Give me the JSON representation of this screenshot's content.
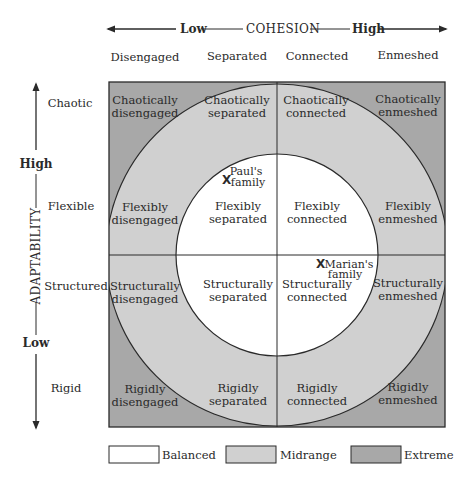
{
  "colors": {
    "balanced": "#ffffff",
    "midrange": "#d0d0d0",
    "extreme": "#a8a8a8",
    "line": "#2a2a2a",
    "text": "#2a2a2a"
  },
  "cohesion_axis": {
    "title": "COHESION",
    "low_label": "Low",
    "high_label": "High",
    "levels": [
      "Disengaged",
      "Separated",
      "Connected",
      "Enmeshed"
    ]
  },
  "adaptability_axis": {
    "title": "ADAPTABILITY",
    "high_label": "High",
    "low_label": "Low",
    "levels": [
      "Chaotic",
      "Flexible",
      "Structured",
      "Rigid"
    ]
  },
  "cells": [
    {
      "line1": "Chaotically",
      "line2": "disengaged",
      "type": "extreme"
    },
    {
      "line1": "Chaotically",
      "line2": "separated",
      "type": "midrange"
    },
    {
      "line1": "Chaotically",
      "line2": "connected",
      "type": "midrange"
    },
    {
      "line1": "Chaotically",
      "line2": "enmeshed",
      "type": "extreme"
    },
    {
      "line1": "Flexibly",
      "line2": "disengaged",
      "type": "midrange"
    },
    {
      "line1": "Flexibly",
      "line2": "separated",
      "type": "balanced"
    },
    {
      "line1": "Flexibly",
      "line2": "connected",
      "type": "balanced"
    },
    {
      "line1": "Flexibly",
      "line2": "enmeshed",
      "type": "midrange"
    },
    {
      "line1": "Structurally",
      "line2": "disengaged",
      "type": "midrange"
    },
    {
      "line1": "Structurally",
      "line2": "separated",
      "type": "balanced"
    },
    {
      "line1": "Structurally",
      "line2": "connected",
      "type": "balanced"
    },
    {
      "line1": "Structurally",
      "line2": "enmeshed",
      "type": "midrange"
    },
    {
      "line1": "Rigidly",
      "line2": "disengaged",
      "type": "extreme"
    },
    {
      "line1": "Rigidly",
      "line2": "separated",
      "type": "midrange"
    },
    {
      "line1": "Rigidly",
      "line2": "connected",
      "type": "midrange"
    },
    {
      "line1": "Rigidly",
      "line2": "enmeshed",
      "type": "extreme"
    }
  ],
  "markers": [
    {
      "symbol": "X",
      "line1": "Paul's",
      "line2": "family"
    },
    {
      "symbol": "X",
      "line1": "Marian's",
      "line2": "family"
    }
  ],
  "legend": [
    {
      "label": "Balanced",
      "type": "balanced"
    },
    {
      "label": "Midrange",
      "type": "midrange"
    },
    {
      "label": "Extreme",
      "type": "extreme"
    }
  ]
}
